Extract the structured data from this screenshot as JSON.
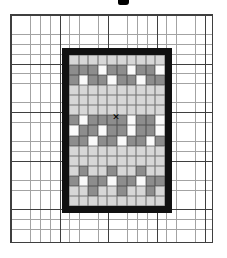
{
  "figure": {
    "type": "stitch-pattern-chart"
  },
  "colors": {
    "paper": "#ffffff",
    "grid_line_thin": "#a3a3a3",
    "grid_line_bold": "#3f3f3f",
    "frame": "#111111",
    "cell_light": "#d7d7d7",
    "cell_dark": "#8d8d8d",
    "cell_white": "#fafafa",
    "marker": "#000000"
  },
  "graph_paper": {
    "cells_thin_px": 9.7,
    "bold_every_cells": 5
  },
  "pattern": {
    "cols": 10,
    "rows": 15,
    "legend": {
      "L": "light",
      "D": "dark",
      "W": "white"
    },
    "rows_data": [
      "LLLLLLLLLL",
      "DDDWDDWDDW",
      "DWDDWDDWDD",
      "LLLLLLLLLL",
      "LLLLLLLLLL",
      "LLLLLLLLLL",
      "DWDDDDWDDW",
      "WDDWDDWDDW",
      "DDWDDWDDWD",
      "LLLLLLLLLL",
      "LLLLLLLLLL",
      "LDLLDLLDLL",
      "DWDDWDDWDD",
      "LLDLLDLLDL",
      "LLLLLLLLLL"
    ],
    "marker": {
      "glyph": "✕",
      "col": 5,
      "row": 7
    }
  }
}
